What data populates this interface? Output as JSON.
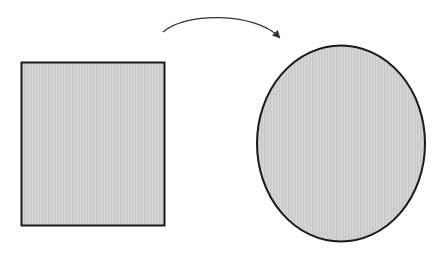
{
  "diagram": {
    "colors": {
      "background": "#ffffff",
      "shape_fill": "#cfcfcf",
      "stroke": "#1a1a1a",
      "arrow": "#333333"
    },
    "shapes": [
      {
        "id": "rectangle",
        "type": "rect",
        "x": 21,
        "y": 62,
        "width": 144,
        "height": 164
      },
      {
        "id": "ellipse",
        "type": "ellipse",
        "cx": 341,
        "cy": 143.5,
        "rx": 84,
        "ry": 98
      }
    ],
    "connector": {
      "type": "curved-arrow",
      "from": "rectangle",
      "to": "ellipse"
    }
  }
}
